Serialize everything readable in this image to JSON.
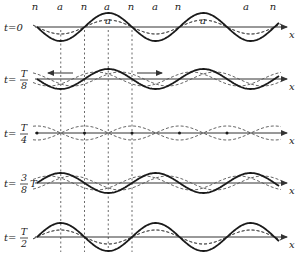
{
  "diagram": {
    "axis_label": "x",
    "node_label": "n",
    "antinode_label": "a",
    "colors": {
      "ink": "#1a1a1a",
      "axis": "#333333",
      "dashed": "#555555",
      "guide": "#444444"
    },
    "geometry": {
      "x_start": 37,
      "x_end": 285,
      "wavelength": 95,
      "nodes_x": [
        37,
        84.5,
        132,
        179.5,
        227,
        274.5
      ],
      "antinodes_x": [
        60.75,
        108.25,
        155.75,
        203.25,
        250.75
      ],
      "guide_lines_x": [
        60.75,
        84.5,
        108.25,
        132
      ],
      "guide_y_range": [
        30,
        252
      ]
    },
    "top_labels": [
      {
        "text": "n",
        "x": 35,
        "y": 10
      },
      {
        "text": "a",
        "x": 60,
        "y": 10
      },
      {
        "text": "n",
        "x": 84,
        "y": 10
      },
      {
        "text": "a",
        "x": 107,
        "y": 10
      },
      {
        "text": "n",
        "x": 131,
        "y": 10
      },
      {
        "text": "a",
        "x": 155,
        "y": 10
      },
      {
        "text": "n",
        "x": 178,
        "y": 10
      },
      {
        "text": "a",
        "x": 246,
        "y": 10
      },
      {
        "text": "n",
        "x": 273,
        "y": 10
      },
      {
        "text": "a",
        "x": 108,
        "y": 24
      },
      {
        "text": "a",
        "x": 203,
        "y": 24
      }
    ],
    "rows": [
      {
        "id": "t0",
        "label_prefix": "t=",
        "label_value": "0",
        "fraction": null,
        "axis_y": 27,
        "standing_amplitude": 14,
        "standing_phase": 0,
        "traveling_amplitude": 7,
        "traveling_offset": 0,
        "show_arrows": false
      },
      {
        "id": "t_T8",
        "label_prefix": "t=",
        "fraction": {
          "num": "T",
          "den": "8",
          "suffix": ""
        },
        "axis_y": 79,
        "standing_amplitude": 10,
        "traveling_amplitude": 7,
        "traveling_offset": 11.875,
        "show_arrows": true
      },
      {
        "id": "t_T4",
        "label_prefix": "t=",
        "fraction": {
          "num": "T",
          "den": "4",
          "suffix": ""
        },
        "axis_y": 133,
        "standing_amplitude": 0,
        "traveling_amplitude": 7,
        "traveling_offset": 23.75,
        "show_arrows": false
      },
      {
        "id": "t_3T8",
        "label_prefix": "t=",
        "fraction": {
          "num": "3",
          "den": "8",
          "suffix": "T"
        },
        "axis_y": 183,
        "standing_amplitude": -10,
        "traveling_amplitude": 7,
        "traveling_offset": 35.625,
        "show_arrows": false
      },
      {
        "id": "t_T2",
        "label_prefix": "t=",
        "fraction": {
          "num": "T",
          "den": "2",
          "suffix": ""
        },
        "axis_y": 237,
        "standing_amplitude": -14,
        "traveling_amplitude": 7,
        "traveling_offset": 47.5,
        "show_arrows": false
      }
    ],
    "arrows": {
      "left": {
        "x1": 73,
        "x2": 48,
        "y": 73
      },
      "right": {
        "x1": 137,
        "x2": 162,
        "y": 73
      }
    }
  }
}
